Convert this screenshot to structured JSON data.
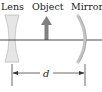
{
  "labels": {
    "lens": "Lens",
    "object": "Object",
    "mirror": "Mirror",
    "distance": "d"
  },
  "colors": {
    "lens_fill": "#e4e4e4",
    "lens_stroke": "#bdbdbd",
    "object_arrow": "#808080",
    "mirror": "#bdbdbd",
    "axis": "#333333"
  }
}
